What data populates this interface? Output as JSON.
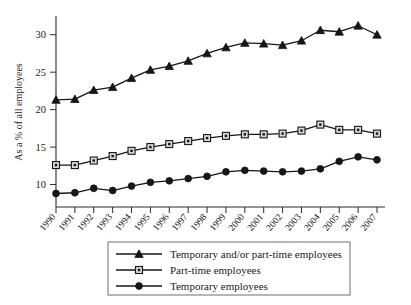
{
  "chart_data": {
    "type": "line",
    "title": "",
    "xlabel": "",
    "ylabel": "As a % of all employees",
    "categories": [
      "1990",
      "1991",
      "1992",
      "1993",
      "1994",
      "1995",
      "1996",
      "1997",
      "1998",
      "1999",
      "2000",
      "2001",
      "2002",
      "2003",
      "2004",
      "2005",
      "2006",
      "2007"
    ],
    "ylim": [
      7,
      32.5
    ],
    "yticks": [
      10,
      15,
      20,
      25,
      30
    ],
    "ytick_labels": [
      "10",
      "15",
      "20",
      "25",
      "30"
    ],
    "grid": false,
    "legend_position": "bottom",
    "series": [
      {
        "name": "Temporary and/or part-time employees",
        "marker": "triangle",
        "values": [
          21.3,
          21.4,
          22.6,
          23.0,
          24.2,
          25.3,
          25.8,
          26.5,
          27.5,
          28.3,
          28.9,
          28.8,
          28.6,
          29.2,
          30.6,
          30.4,
          31.2,
          30.0
        ]
      },
      {
        "name": "Part-time employees",
        "marker": "square",
        "values": [
          12.6,
          12.6,
          13.2,
          13.8,
          14.5,
          15.0,
          15.4,
          15.8,
          16.2,
          16.5,
          16.7,
          16.7,
          16.8,
          17.2,
          18.0,
          17.3,
          17.3,
          16.8
        ]
      },
      {
        "name": "Temporary employees",
        "marker": "circle",
        "values": [
          8.8,
          8.9,
          9.5,
          9.2,
          9.8,
          10.3,
          10.5,
          10.8,
          11.1,
          11.7,
          11.9,
          11.8,
          11.7,
          11.8,
          12.1,
          13.1,
          13.7,
          13.3
        ]
      }
    ]
  },
  "axis": {
    "y_title": "As a % of all employees"
  },
  "legend": {
    "items": [
      {
        "label": "Temporary and/or part-time employees",
        "marker": "triangle-marker"
      },
      {
        "label": "Part-time employees",
        "marker": "square-marker"
      },
      {
        "label": "Temporary employees",
        "marker": "circle-marker"
      }
    ]
  }
}
